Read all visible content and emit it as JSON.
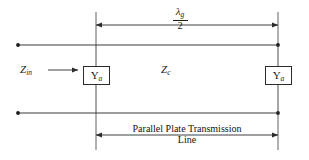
{
  "diagram": {
    "title": "Parallel Plate Transmission Line",
    "type": "transmission-line-schematic",
    "dimension_top": {
      "label_numerator": "λ",
      "label_numerator_subscript": "g",
      "label_denominator": "2",
      "meaning": "half guide wavelength"
    },
    "dimension_bottom": {
      "label_line1": "Parallel Plate Transmission",
      "label_line2": "Line"
    },
    "impedances": {
      "input": {
        "symbol": "Z",
        "subscript": "in",
        "arrow": "right-arrow"
      },
      "characteristic": {
        "symbol": "Z",
        "subscript": "c"
      }
    },
    "admittance_boxes": [
      {
        "symbol": "Y",
        "subscript": "a",
        "position": "left"
      },
      {
        "symbol": "Y",
        "subscript": "a",
        "position": "right"
      }
    ],
    "colors": {
      "line": "#2b2b2b",
      "text": "#1a1a1a",
      "background": "#ffffff"
    }
  }
}
